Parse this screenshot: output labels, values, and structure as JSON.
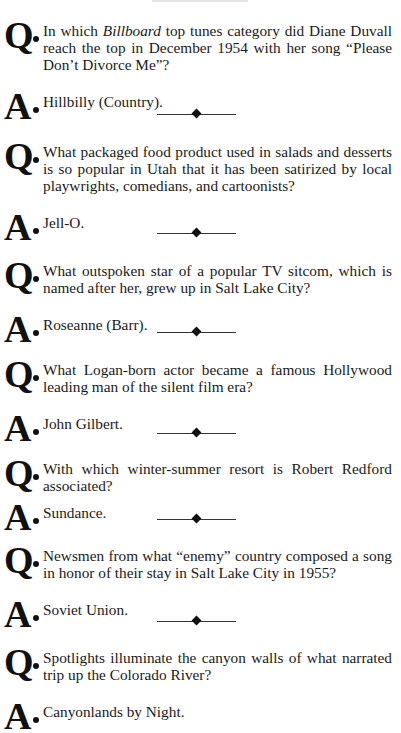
{
  "document": {
    "q_marker": "Q",
    "a_marker": "A",
    "items": [
      {
        "question_pre": "In which ",
        "question_italic": "Billboard",
        "question_post": " top tunes category did Diane Duvall reach the top in December 1954 with her song “Please Don’t Divorce Me”?",
        "answer": "Hillbilly (Country)."
      },
      {
        "question": "What packaged food product used in salads and desserts is so popular in Utah that it has been satirized by local play­wrights, comedians, and cartoonists?",
        "answer": "Jell-O."
      },
      {
        "question": "What outspoken star of a popular TV sitcom, which is named after her, grew up in Salt Lake City?",
        "answer": "Roseanne (Barr)."
      },
      {
        "question": "What Logan-born actor became a famous Hollywood leading man of the silent film era?",
        "answer": "John Gilbert."
      },
      {
        "question": "With which winter-summer resort is Robert Redford associated?",
        "answer": "Sundance."
      },
      {
        "question": "Newsmen from what “enemy” country composed a song in honor of their stay in Salt Lake City in 1955?",
        "answer": "Soviet Union."
      },
      {
        "question": "Spotlights illuminate the canyon walls of what narrated trip up the Colorado River?",
        "answer": "Canyonlands by Night."
      }
    ]
  }
}
